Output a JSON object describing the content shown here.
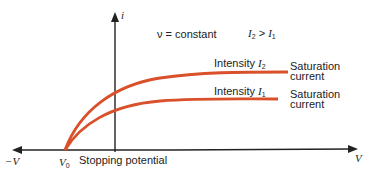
{
  "diagram": {
    "type": "photoelectric-iv-curve",
    "axes": {
      "y_label": "i",
      "x_label": "V",
      "x_neg_label": "−V"
    },
    "condition_left": "ν = constant",
    "condition_right_a": "I",
    "condition_right_a_sub": "2",
    "condition_right_op": " > ",
    "condition_right_b": "I",
    "condition_right_b_sub": "1",
    "v0_label": "V",
    "v0_sub": "0",
    "stopping_label": "Stopping potential",
    "curves": [
      {
        "name": "intensity-2",
        "label": "Intensity ",
        "label_var": "I",
        "label_sub": "2",
        "saturation_line1": "Saturation",
        "saturation_line2": "current"
      },
      {
        "name": "intensity-1",
        "label": "Intensity ",
        "label_var": "I",
        "label_sub": "1",
        "saturation_line1": "Saturation",
        "saturation_line2": "current"
      }
    ],
    "colors": {
      "curve": "#d9502a",
      "axis": "#222222"
    }
  }
}
